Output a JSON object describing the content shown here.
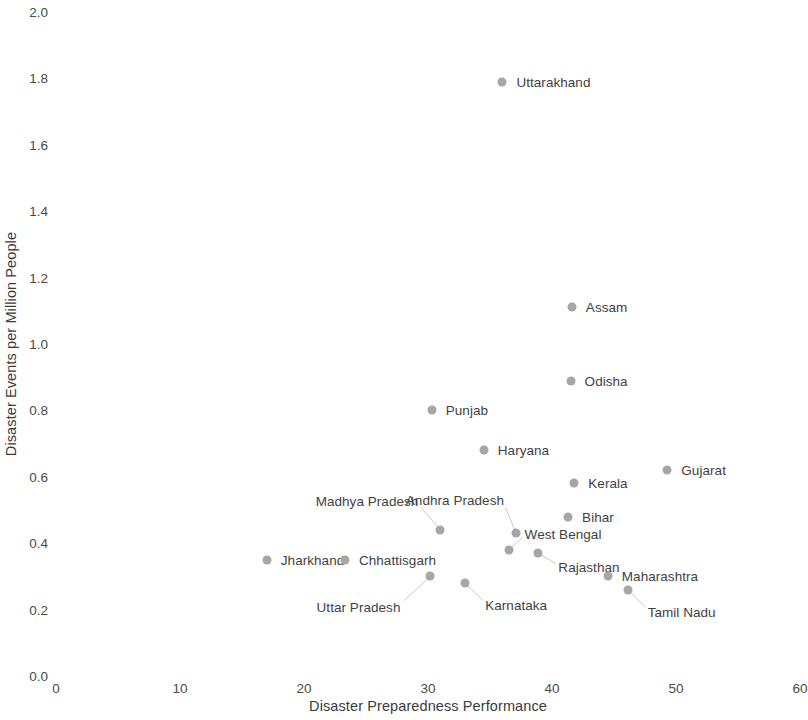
{
  "chart_data": {
    "type": "scatter",
    "title": "",
    "xlabel": "Disaster Preparedness Performance",
    "ylabel": "Disaster Events per Million People",
    "xlim": [
      0,
      60
    ],
    "ylim": [
      0.0,
      2.0
    ],
    "xticks": [
      "0",
      "10",
      "20",
      "30",
      "40",
      "50",
      "60"
    ],
    "xtick_values": [
      0,
      10,
      20,
      30,
      40,
      50,
      60
    ],
    "yticks": [
      "0.0",
      "0.2",
      "0.4",
      "0.6",
      "0.8",
      "1.0",
      "1.2",
      "1.4",
      "1.6",
      "1.8",
      "2.0"
    ],
    "ytick_values": [
      0.0,
      0.2,
      0.4,
      0.6,
      0.8,
      1.0,
      1.2,
      1.4,
      1.6,
      1.8,
      2.0
    ],
    "grid": false,
    "legend": "none",
    "marker_color": "#a6a6a6",
    "label_color": "#3f3f3f",
    "points": [
      {
        "label": "Uttarakhand",
        "x": 36.0,
        "y": 1.79,
        "label_pos": "right"
      },
      {
        "label": "Assam",
        "x": 41.6,
        "y": 1.11,
        "label_pos": "right"
      },
      {
        "label": "Odisha",
        "x": 41.5,
        "y": 0.89,
        "label_pos": "right"
      },
      {
        "label": "Punjab",
        "x": 30.3,
        "y": 0.8,
        "label_pos": "right"
      },
      {
        "label": "Haryana",
        "x": 34.5,
        "y": 0.68,
        "label_pos": "right"
      },
      {
        "label": "Gujarat",
        "x": 49.3,
        "y": 0.62,
        "label_pos": "right"
      },
      {
        "label": "Kerala",
        "x": 41.8,
        "y": 0.58,
        "label_pos": "right"
      },
      {
        "label": "Bihar",
        "x": 41.3,
        "y": 0.48,
        "label_pos": "right"
      },
      {
        "label": "Madhya Pradesh",
        "x": 31.0,
        "y": 0.44,
        "label_pos": "leader-upleft"
      },
      {
        "label": "Andhra Pradesh",
        "x": 37.1,
        "y": 0.43,
        "label_pos": "leader-up"
      },
      {
        "label": "West Bengal",
        "x": 36.5,
        "y": 0.38,
        "label_pos": "leader-upright"
      },
      {
        "label": "Rajasthan",
        "x": 38.9,
        "y": 0.37,
        "label_pos": "leader-right"
      },
      {
        "label": "Jharkhand",
        "x": 17.0,
        "y": 0.35,
        "label_pos": "right"
      },
      {
        "label": "Chhattisgarh",
        "x": 23.3,
        "y": 0.35,
        "label_pos": "right"
      },
      {
        "label": "Maharashtra",
        "x": 44.5,
        "y": 0.3,
        "label_pos": "right"
      },
      {
        "label": "Uttar Pradesh",
        "x": 30.2,
        "y": 0.3,
        "label_pos": "leader-downleft"
      },
      {
        "label": "Karnataka",
        "x": 33.0,
        "y": 0.28,
        "label_pos": "leader-downright"
      },
      {
        "label": "Tamil Nadu",
        "x": 46.1,
        "y": 0.26,
        "label_pos": "leader-downright"
      }
    ]
  }
}
